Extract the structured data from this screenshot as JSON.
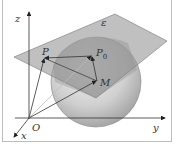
{
  "figure": {
    "type": "3d-geometry-diagram",
    "labels": {
      "z_axis": "z",
      "y_axis": "y",
      "x_axis": "x",
      "origin": "O",
      "plane": "ε",
      "point_p": "P",
      "point_p0": "P",
      "point_p0_subscript": "0",
      "point_m": "M"
    },
    "colors": {
      "plane": "#9a9a9a",
      "sphere_light": "#e6e6e6",
      "sphere_dark": "#a8a8a8",
      "lines": "#333333",
      "frame": "#bdbdbd"
    }
  }
}
